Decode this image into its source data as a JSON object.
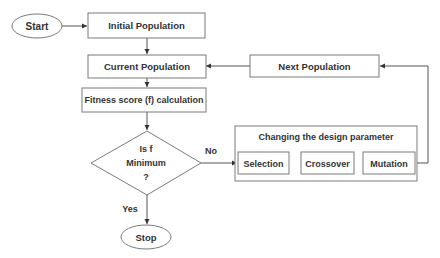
{
  "diagram": {
    "type": "flowchart",
    "nodes": {
      "start": {
        "label": "Start",
        "shape": "ellipse"
      },
      "initial_population": {
        "label": "Initial Population",
        "shape": "rect"
      },
      "current_population": {
        "label": "Current Population",
        "shape": "rect"
      },
      "fitness": {
        "label": "Fitness score (f) calculation",
        "shape": "rect"
      },
      "decision": {
        "line1": "Is f",
        "line2": "Minimum",
        "line3": "?",
        "shape": "diamond"
      },
      "stop": {
        "label": "Stop",
        "shape": "ellipse"
      },
      "next_population": {
        "label": "Next Population",
        "shape": "rect"
      },
      "group": {
        "label": "Changing the design parameter",
        "shape": "group-rect"
      },
      "selection": {
        "label": "Selection",
        "shape": "rect"
      },
      "crossover": {
        "label": "Crossover",
        "shape": "rect"
      },
      "mutation": {
        "label": "Mutation",
        "shape": "rect"
      }
    },
    "edges": [
      {
        "from": "start",
        "to": "initial_population",
        "label": ""
      },
      {
        "from": "initial_population",
        "to": "current_population",
        "label": ""
      },
      {
        "from": "current_population",
        "to": "fitness",
        "label": ""
      },
      {
        "from": "fitness",
        "to": "decision",
        "label": ""
      },
      {
        "from": "decision",
        "to": "stop",
        "label": "Yes"
      },
      {
        "from": "decision",
        "to": "selection",
        "label": "No"
      },
      {
        "from": "selection",
        "to": "crossover",
        "label": ""
      },
      {
        "from": "crossover",
        "to": "mutation",
        "label": ""
      },
      {
        "from": "mutation",
        "to": "next_population",
        "label": ""
      },
      {
        "from": "next_population",
        "to": "current_population",
        "label": ""
      }
    ],
    "edge_labels": {
      "yes": "Yes",
      "no": "No"
    },
    "colors": {
      "stroke": "#7a7a7a",
      "line": "#555555",
      "text": "#333333",
      "background": "#ffffff"
    }
  }
}
